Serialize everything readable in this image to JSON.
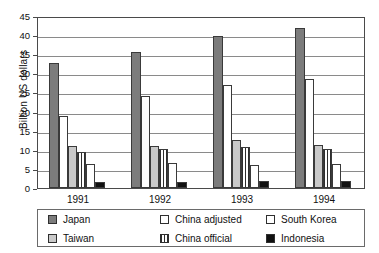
{
  "chart_data": {
    "type": "bar",
    "title": "",
    "xlabel": "",
    "ylabel": "Billion US dollars",
    "ylim": [
      0,
      45
    ],
    "yticks": [
      0,
      5,
      10,
      15,
      20,
      25,
      30,
      35,
      40,
      45
    ],
    "grid": true,
    "legend_position": "bottom",
    "categories": [
      "1991",
      "1992",
      "1993",
      "1994"
    ],
    "series": [
      {
        "name": "Japan",
        "color": "#7c7c7c",
        "pattern": "solid-gray",
        "values": [
          32.7,
          35.6,
          39.8,
          41.8
        ]
      },
      {
        "name": "China adjusted",
        "color": "#ffffff",
        "pattern": "solid-white",
        "values": [
          18.8,
          24.1,
          27.0,
          28.5
        ]
      },
      {
        "name": "Taiwan",
        "color": "#c9c9c9",
        "pattern": "solid-light-gray",
        "values": [
          10.9,
          11.1,
          12.6,
          11.3
        ]
      },
      {
        "name": "China official",
        "color": "#2e2e2e",
        "pattern": "vertical-stripes",
        "values": [
          9.3,
          10.1,
          10.7,
          10.1
        ]
      },
      {
        "name": "South Korea",
        "color": "#ffffff",
        "pattern": "solid-white",
        "values": [
          6.2,
          6.6,
          6.0,
          6.3
        ]
      },
      {
        "name": "Indonesia",
        "color": "#111111",
        "pattern": "solid-black",
        "values": [
          1.5,
          1.7,
          1.8,
          1.8
        ]
      }
    ]
  },
  "axis": {
    "y_title": "Billion US dollars",
    "y_tick_labels": [
      "45",
      "40",
      "35",
      "30",
      "25",
      "20",
      "15",
      "10",
      "5",
      "0"
    ],
    "x_tick_labels": [
      "1991",
      "1992",
      "1993",
      "1994"
    ]
  },
  "legend": {
    "items": [
      {
        "label": "Japan",
        "swatch": "swatch-japan"
      },
      {
        "label": "China adjusted",
        "swatch": "swatch-china-adjusted"
      },
      {
        "label": "South Korea",
        "swatch": "swatch-south-korea"
      },
      {
        "label": "Taiwan",
        "swatch": "swatch-taiwan"
      },
      {
        "label": "China official",
        "swatch": "swatch-china-official"
      },
      {
        "label": "Indonesia",
        "swatch": "swatch-indonesia"
      }
    ]
  }
}
